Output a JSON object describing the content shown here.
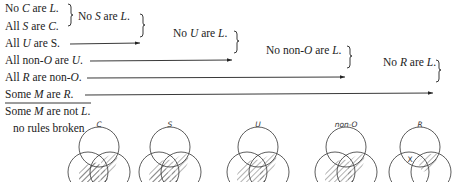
{
  "premises": [
    {
      "pre": "No ",
      "t1": "C",
      "mid": " are ",
      "t2": "L",
      "post": "."
    },
    {
      "pre": "All ",
      "t1": "S",
      "mid": " are ",
      "t2": "C",
      "post": "."
    },
    {
      "pre": "All ",
      "t1": "U",
      "mid": " are S",
      "t2": "",
      "post": "."
    },
    {
      "pre": "All non-",
      "t1": "O",
      "mid": " are ",
      "t2": "U",
      "post": "."
    },
    {
      "pre": "All ",
      "t1": "R",
      "mid": " are non-",
      "t2": "O",
      "post": "."
    },
    {
      "pre": "Some ",
      "t1": "M",
      "mid": " are ",
      "t2": "R",
      "post": "."
    }
  ],
  "conclusion": {
    "pre": "Some ",
    "t1": "M",
    "mid": " are not ",
    "t2": "L",
    "post": "."
  },
  "intermediate": [
    {
      "pre": "No ",
      "t1": "S",
      "mid": " are ",
      "t2": "L",
      "post": "."
    },
    {
      "pre": "No ",
      "t1": "U",
      "mid": " are ",
      "t2": "L",
      "post": "."
    },
    {
      "pre": "No non-",
      "t1": "O",
      "mid": " are ",
      "t2": "L",
      "post": "."
    },
    {
      "pre": "No ",
      "t1": "R",
      "mid": " are ",
      "t2": "L",
      "post": "."
    }
  ],
  "status": "no rules broken",
  "venn_labels": [
    "C",
    "S",
    "U",
    "non-O",
    "R"
  ],
  "venn_marker": "X",
  "colors": {
    "ink": "#222222",
    "hatch": "#555555"
  }
}
